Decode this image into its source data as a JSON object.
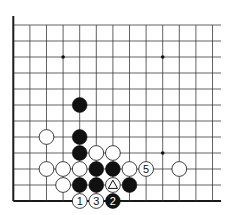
{
  "diagram": {
    "type": "go-board-fragment",
    "grid": {
      "cols": 13,
      "rows": 12,
      "x0": 13.3,
      "y0": 25,
      "dx": 16.6,
      "dy": 16,
      "extend_right": 221,
      "left_edge": true,
      "bottom_edge": true,
      "line_color": "#3a3a3a",
      "edge_color": "#1a1a1a"
    },
    "star_points": [
      {
        "col": 3,
        "row": 2
      },
      {
        "col": 9,
        "row": 2
      },
      {
        "col": 9,
        "row": 8
      }
    ],
    "stones": [
      {
        "color": "black",
        "col": 4,
        "row": 5,
        "label": ""
      },
      {
        "color": "white",
        "col": 2,
        "row": 7,
        "label": ""
      },
      {
        "color": "black",
        "col": 4,
        "row": 7,
        "label": ""
      },
      {
        "color": "black",
        "col": 4,
        "row": 8,
        "label": ""
      },
      {
        "color": "white",
        "col": 5,
        "row": 8,
        "label": ""
      },
      {
        "color": "white",
        "col": 6,
        "row": 8,
        "label": ""
      },
      {
        "color": "white",
        "col": 2,
        "row": 9,
        "label": ""
      },
      {
        "color": "white",
        "col": 3,
        "row": 9,
        "label": ""
      },
      {
        "color": "white",
        "col": 4,
        "row": 9,
        "label": ""
      },
      {
        "color": "black",
        "col": 5,
        "row": 9,
        "label": ""
      },
      {
        "color": "black",
        "col": 6,
        "row": 9,
        "label": ""
      },
      {
        "color": "white",
        "col": 7,
        "row": 9,
        "label": ""
      },
      {
        "color": "white",
        "col": 8,
        "row": 9,
        "label": "5"
      },
      {
        "color": "white",
        "col": 10,
        "row": 9,
        "label": ""
      },
      {
        "color": "white",
        "col": 3,
        "row": 10,
        "label": ""
      },
      {
        "color": "black",
        "col": 4,
        "row": 10,
        "label": ""
      },
      {
        "color": "black",
        "col": 5,
        "row": 10,
        "label": ""
      },
      {
        "color": "white",
        "col": 6,
        "row": 10,
        "label": "",
        "mark": "triangle"
      },
      {
        "color": "black",
        "col": 7,
        "row": 10,
        "label": ""
      },
      {
        "color": "white",
        "col": 4,
        "row": 11,
        "label": "1"
      },
      {
        "color": "white",
        "col": 5,
        "row": 11,
        "label": "3"
      },
      {
        "color": "black",
        "col": 6,
        "row": 11,
        "label": "2"
      }
    ]
  }
}
